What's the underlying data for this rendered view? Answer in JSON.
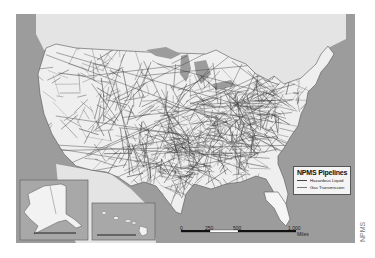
{
  "map": {
    "title": "NPMS Pipelines",
    "legend": {
      "title": "NPMS Pipelines",
      "items": [
        {
          "label": "Hazardous Liquid",
          "style": "solid-dark"
        },
        {
          "label": "Gas Transmission",
          "style": "solid-gray"
        }
      ]
    },
    "scale_bar": {
      "labels": [
        "0",
        "250",
        "500",
        "1,000"
      ],
      "unit": "Miles"
    },
    "insets": [
      {
        "name": "Alaska",
        "scale_labels": [
          "0",
          "100",
          "200",
          "300"
        ]
      },
      {
        "name": "Hawaii",
        "scale_labels": [
          "0",
          "50",
          "100",
          "200"
        ]
      }
    ],
    "credit": "NPMS",
    "colors": {
      "ocean": "#9c9c9c",
      "land": "#ededed",
      "pipeline": "#3a3a3a",
      "border": "#555555"
    }
  }
}
